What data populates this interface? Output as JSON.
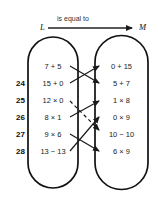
{
  "header": {
    "caption": "is equal to",
    "left_set_label": "L",
    "right_set_label": "M",
    "arrow_icon": "right-arrow-icon"
  },
  "colors": {
    "ink": "#1a1a1a",
    "outline": "#111111",
    "background": "#ffffff"
  },
  "left_set": {
    "name": "L",
    "items": [
      {
        "number": "",
        "expression": "7 + 5"
      },
      {
        "number": "24",
        "expression": "15 + 0"
      },
      {
        "number": "25",
        "expression": "12 × 0"
      },
      {
        "number": "26",
        "expression": "8 × 1"
      },
      {
        "number": "27",
        "expression": "9 × 6"
      },
      {
        "number": "28",
        "expression": "13 − 13"
      }
    ]
  },
  "right_set": {
    "name": "M",
    "items": [
      {
        "expression": "0 + 15"
      },
      {
        "expression": "5 + 7"
      },
      {
        "expression": "1 × 8"
      },
      {
        "expression": "0 × 9"
      },
      {
        "expression": "10 − 10"
      },
      {
        "expression": "6 × 9"
      }
    ]
  },
  "mappings": [
    {
      "from": "7 + 5",
      "to": "5 + 7",
      "style": "solid"
    },
    {
      "from": "15 + 0",
      "to": "0 + 15",
      "style": "solid"
    },
    {
      "from": "12 × 0",
      "to": "10 − 10",
      "style": "dashed"
    },
    {
      "from": "8 × 1",
      "to": "1 × 8",
      "style": "solid"
    },
    {
      "from": "9 × 6",
      "to": "6 × 9",
      "style": "solid"
    },
    {
      "from": "13 − 13",
      "to": "0 × 9",
      "style": "solid"
    }
  ]
}
